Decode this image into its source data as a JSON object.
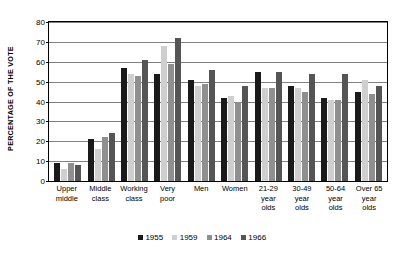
{
  "chart_data": {
    "type": "bar",
    "title": "",
    "xlabel": "",
    "ylabel": "PERCENTAGE OF THE VOTE",
    "ylim": [
      0,
      80
    ],
    "yticks": [
      0,
      10,
      20,
      30,
      40,
      50,
      60,
      70,
      80
    ],
    "grid": true,
    "legend_position": "bottom",
    "categories": [
      "Upper middle",
      "Middle class",
      "Working class",
      "Very poor",
      "Men",
      "Women",
      "21-29 year olds",
      "30-49 year olds",
      "50-64 year olds",
      "Over 65 year olds"
    ],
    "category_lines": [
      [
        "Upper",
        "middle"
      ],
      [
        "Middle",
        "class"
      ],
      [
        "Working",
        "class"
      ],
      [
        "Very",
        "poor"
      ],
      [
        "Men"
      ],
      [
        "Women"
      ],
      [
        "21-29",
        "year",
        "olds"
      ],
      [
        "30-49",
        "year",
        "olds"
      ],
      [
        "50-64",
        "year",
        "olds"
      ],
      [
        "Over 65",
        "year",
        "olds"
      ]
    ],
    "series": [
      {
        "name": "1955",
        "color": "#1a1a1a",
        "values": [
          9,
          21,
          57,
          54,
          51,
          42,
          55,
          48,
          42,
          45
        ]
      },
      {
        "name": "1959",
        "color": "#cfcfcf",
        "values": [
          6,
          16,
          54,
          68,
          48,
          43,
          47,
          47,
          41,
          51
        ]
      },
      {
        "name": "1964",
        "color": "#8f8f8f",
        "values": [
          9,
          22,
          53,
          59,
          49,
          40,
          47,
          45,
          41,
          44
        ]
      },
      {
        "name": "1966",
        "color": "#555555",
        "values": [
          8,
          24,
          61,
          72,
          56,
          48,
          55,
          54,
          54,
          48
        ]
      }
    ]
  }
}
